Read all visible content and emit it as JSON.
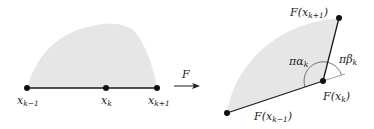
{
  "colors": {
    "fill": "#e6e6e6",
    "stroke": "#1a1a1a",
    "background": "#ffffff"
  },
  "left_panel": {
    "points": [
      {
        "label": "x",
        "sub": "k−1"
      },
      {
        "label": "x",
        "sub": "k"
      },
      {
        "label": "x",
        "sub": "k+1"
      }
    ]
  },
  "map_arrow": {
    "label": "F"
  },
  "right_panel": {
    "points": [
      {
        "label": "F(x",
        "sub": "k−1",
        "close": ")"
      },
      {
        "label": "F(x",
        "sub": "k",
        "close": ")"
      },
      {
        "label": "F(x",
        "sub": "k+1",
        "close": ")"
      }
    ],
    "angles": [
      {
        "label": "πα",
        "sub": "k"
      },
      {
        "label": "πβ",
        "sub": "k"
      }
    ]
  }
}
